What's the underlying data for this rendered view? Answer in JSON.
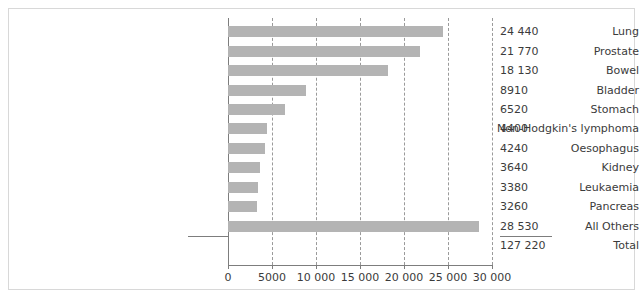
{
  "chart_data": {
    "type": "bar",
    "orientation": "horizontal",
    "title": "",
    "subtitle": "",
    "xlabel": "",
    "ylabel": "",
    "grid": true,
    "legend": false,
    "xlim": [
      0,
      30000
    ],
    "xticks": [
      0,
      5000,
      10000,
      15000,
      20000,
      25000,
      30000
    ],
    "xticklabels": [
      "0",
      "5000",
      "10 000",
      "15 000",
      "20 000",
      "25 000",
      "30 000"
    ],
    "categories": [
      "Lung",
      "Prostate",
      "Bowel",
      "Bladder",
      "Stomach",
      "Non-Hodgkin's lymphoma",
      "Oesophagus",
      "Kidney",
      "Leukaemia",
      "Pancreas",
      "All Others",
      "Total"
    ],
    "values": [
      24440,
      21770,
      18130,
      8910,
      6520,
      4400,
      4240,
      3640,
      3380,
      3260,
      28530,
      127220
    ],
    "value_labels": [
      "24 440",
      "21 770",
      "18 130",
      "8910",
      "6520",
      "4400",
      "4240",
      "3640",
      "3380",
      "3260",
      "28 530",
      "127 220"
    ],
    "bars_drawn": [
      true,
      true,
      true,
      true,
      true,
      true,
      true,
      true,
      true,
      true,
      true,
      false
    ],
    "bar_color": "#b4b4b4",
    "axis_color": "#7d7d7d",
    "grid_color": "#9a9a9a",
    "text_color": "#3b3b3b",
    "frame_color": "#d8d8d8",
    "background": "#ffffff"
  }
}
